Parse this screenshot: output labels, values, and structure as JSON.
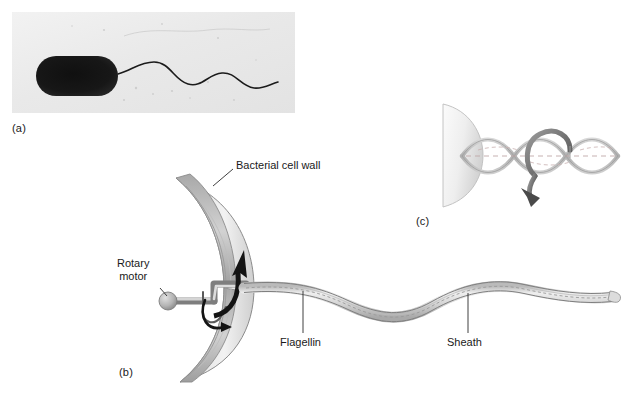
{
  "figure": {
    "background_color": "#ffffff",
    "panels": [
      {
        "id": "a",
        "label": "(a)",
        "type": "electron-micrograph",
        "description": "Dark rod-shaped bacterium with a single long wavy flagellum"
      },
      {
        "id": "b",
        "label": "(b)",
        "type": "cutaway-diagram",
        "description": "Crescent cross-section of bacterial cell wall with rotary motor, hook and sheathed flagellum"
      },
      {
        "id": "c",
        "label": "(c)",
        "type": "helix-rotation-diagram",
        "description": "Helical flagellum rotating about its axis, shown with a curved rotation arrow"
      }
    ],
    "callouts": [
      {
        "id": "cell-wall",
        "text": "Bacterial cell wall"
      },
      {
        "id": "rotary-motor",
        "text": "Rotary\nmotor",
        "line1": "Rotary",
        "line2": "motor"
      },
      {
        "id": "flagellin",
        "text": "Flagellin"
      },
      {
        "id": "sheath",
        "text": "Sheath"
      }
    ],
    "colors": {
      "wall_light": "#f0f0f0",
      "wall_mid": "#c9c9c9",
      "wall_dark": "#9a9a9a",
      "outline": "#6e6e6e",
      "arrow_black": "#141414",
      "arrow_gray": "#8a8a8a",
      "text": "#1a1a1a",
      "micrograph_bg": "#ededed",
      "micrograph_cell": "#121212"
    }
  }
}
